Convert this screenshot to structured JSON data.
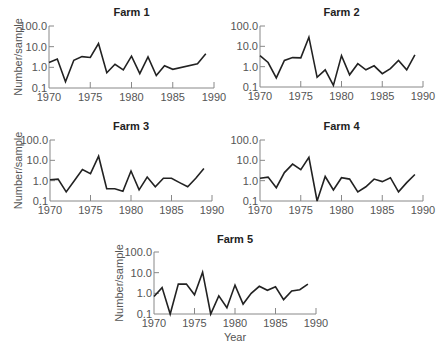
{
  "chart_data": [
    {
      "type": "line",
      "title": "Farm 1",
      "xlabel": "",
      "ylabel": "Number/sample",
      "yscale": "log",
      "ylim": [
        0.1,
        100.0
      ],
      "xlim": [
        1970,
        1990
      ],
      "xticks": [
        "1970",
        "1975",
        "1980",
        "1985",
        "1990"
      ],
      "yticks": [
        "0.1",
        "1.0",
        "10.0",
        "100.0"
      ],
      "grid": false,
      "x": [
        1970,
        1971,
        1972,
        1973,
        1974,
        1975,
        1976,
        1977,
        1978,
        1979,
        1980,
        1981,
        1982,
        1983,
        1984,
        1985,
        1988,
        1989
      ],
      "values": [
        1.7,
        2.5,
        0.2,
        2.2,
        3.3,
        3.0,
        14,
        0.55,
        1.4,
        0.75,
        3.5,
        0.5,
        3.2,
        0.4,
        1.2,
        0.8,
        1.5,
        4.5
      ]
    },
    {
      "type": "line",
      "title": "Farm 2",
      "xlabel": "",
      "ylabel": "",
      "yscale": "log",
      "ylim": [
        0.1,
        100.0
      ],
      "xlim": [
        1970,
        1990
      ],
      "xticks": [
        "1970",
        "1975",
        "1980",
        "1985",
        "1990"
      ],
      "yticks": [
        "0.1",
        "1.0",
        "10.0",
        "100.0"
      ],
      "grid": false,
      "x": [
        1970,
        1971,
        1972,
        1973,
        1974,
        1975,
        1976,
        1977,
        1978,
        1979,
        1980,
        1981,
        1982,
        1983,
        1984,
        1985,
        1986,
        1987,
        1988,
        1989
      ],
      "values": [
        3.5,
        1.6,
        0.28,
        2.0,
        2.8,
        2.7,
        28,
        0.3,
        0.7,
        0.12,
        3.5,
        0.4,
        1.4,
        0.7,
        1.1,
        0.45,
        0.8,
        2.0,
        0.7,
        3.8
      ]
    },
    {
      "type": "line",
      "title": "Farm 3",
      "xlabel": "",
      "ylabel": "Number/sample",
      "yscale": "log",
      "ylim": [
        0.1,
        100.0
      ],
      "xlim": [
        1970,
        1990
      ],
      "xticks": [
        "1970",
        "1975",
        "1980",
        "1985",
        "1990"
      ],
      "yticks": [
        "0.1",
        "1.0",
        "10.0",
        "100.0"
      ],
      "grid": false,
      "x": [
        1970,
        1971,
        1972,
        1973,
        1974,
        1975,
        1976,
        1977,
        1978,
        1979,
        1980,
        1981,
        1982,
        1983,
        1984,
        1985,
        1986,
        1987,
        1988,
        1989
      ],
      "values": [
        1.1,
        1.2,
        0.28,
        1.0,
        3.5,
        2.2,
        16,
        0.4,
        0.4,
        0.3,
        3.0,
        0.35,
        1.5,
        0.5,
        1.3,
        1.3,
        0.8,
        0.5,
        1.3,
        4.0
      ]
    },
    {
      "type": "line",
      "title": "Farm 4",
      "xlabel": "",
      "ylabel": "",
      "yscale": "log",
      "ylim": [
        0.1,
        100.0
      ],
      "xlim": [
        1970,
        1990
      ],
      "xticks": [
        "1970",
        "1975",
        "1980",
        "1985",
        "1990"
      ],
      "yticks": [
        "0.1",
        "1.0",
        "10.0",
        "100.0"
      ],
      "grid": false,
      "x": [
        1970,
        1971,
        1972,
        1973,
        1974,
        1975,
        1976,
        1977,
        1978,
        1979,
        1980,
        1981,
        1982,
        1983,
        1984,
        1985,
        1986,
        1987,
        1988,
        1989
      ],
      "values": [
        1.3,
        1.5,
        0.45,
        2.5,
        6.5,
        3.5,
        14,
        0.1,
        1.6,
        0.35,
        1.4,
        1.2,
        0.28,
        0.5,
        1.2,
        0.9,
        1.4,
        0.28,
        0.8,
        2.0
      ]
    },
    {
      "type": "line",
      "title": "Farm 5",
      "xlabel": "Year",
      "ylabel": "Number/sample",
      "yscale": "log",
      "ylim": [
        0.1,
        100.0
      ],
      "xlim": [
        1970,
        1990
      ],
      "xticks": [
        "1970",
        "1975",
        "1980",
        "1985",
        "1990"
      ],
      "yticks": [
        "0.1",
        "1.0",
        "10.0",
        "100.0"
      ],
      "grid": false,
      "x": [
        1970,
        1971,
        1972,
        1973,
        1974,
        1975,
        1976,
        1977,
        1978,
        1979,
        1980,
        1981,
        1982,
        1983,
        1984,
        1985,
        1986,
        1987,
        1988,
        1989
      ],
      "values": [
        0.7,
        1.9,
        0.1,
        2.8,
        2.8,
        0.85,
        10.5,
        0.1,
        0.75,
        0.2,
        2.5,
        0.3,
        1.0,
        2.2,
        1.4,
        2.1,
        0.5,
        1.3,
        1.5,
        2.8
      ]
    }
  ]
}
